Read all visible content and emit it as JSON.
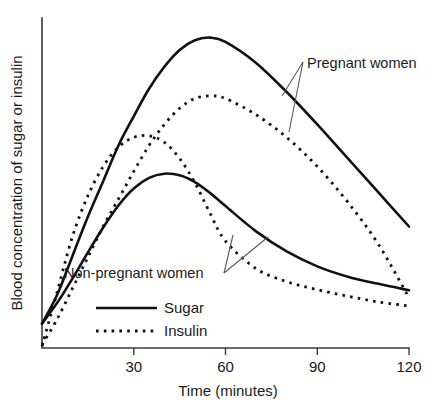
{
  "chart_data": {
    "type": "line",
    "title": "",
    "xlabel": "Time (minutes)",
    "ylabel": "Blood concentration of sugar or insulin",
    "xlim": [
      0,
      120
    ],
    "ylim": [
      0,
      1
    ],
    "xticks": [
      30,
      60,
      90,
      120
    ],
    "xticklabels": [
      "30",
      "60",
      "90",
      "120"
    ],
    "yticks": [],
    "yticklabels": [],
    "grid": false,
    "legend_position": "bottom-left",
    "legend": [
      {
        "label": "Sugar",
        "style": "solid"
      },
      {
        "label": "Insulin",
        "style": "dotted"
      }
    ],
    "annotations": [
      {
        "text": "Pregnant women",
        "points_to": [
          "pregnant-sugar",
          "pregnant-insulin"
        ]
      },
      {
        "text": "Non-pregnant women",
        "points_to": [
          "non-pregnant-sugar",
          "non-pregnant-insulin"
        ]
      }
    ],
    "series": [
      {
        "name": "pregnant-sugar",
        "group": "Pregnant women",
        "measure": "Sugar",
        "style": "solid",
        "x": [
          0,
          5,
          10,
          15,
          20,
          25,
          30,
          35,
          40,
          45,
          50,
          55,
          60,
          70,
          80,
          90,
          100,
          110,
          120
        ],
        "y": [
          0.075,
          0.165,
          0.285,
          0.405,
          0.515,
          0.625,
          0.715,
          0.8,
          0.868,
          0.92,
          0.95,
          0.958,
          0.945,
          0.88,
          0.79,
          0.69,
          0.585,
          0.48,
          0.375
        ]
      },
      {
        "name": "pregnant-insulin",
        "group": "Pregnant women",
        "measure": "Insulin",
        "style": "dotted",
        "x": [
          0,
          5,
          10,
          15,
          20,
          25,
          30,
          35,
          40,
          45,
          50,
          55,
          60,
          70,
          80,
          90,
          100,
          110,
          120
        ],
        "y": [
          0.01,
          0.09,
          0.185,
          0.28,
          0.375,
          0.46,
          0.545,
          0.625,
          0.69,
          0.74,
          0.77,
          0.778,
          0.77,
          0.72,
          0.65,
          0.56,
          0.45,
          0.32,
          0.155
        ]
      },
      {
        "name": "non-pregnant-sugar",
        "group": "Non-pregnant women",
        "measure": "Sugar",
        "style": "solid",
        "x": [
          0,
          5,
          10,
          15,
          20,
          25,
          30,
          35,
          40,
          45,
          50,
          55,
          60,
          70,
          80,
          90,
          100,
          110,
          120
        ],
        "y": [
          0.075,
          0.14,
          0.215,
          0.295,
          0.372,
          0.44,
          0.492,
          0.525,
          0.538,
          0.533,
          0.512,
          0.478,
          0.438,
          0.36,
          0.298,
          0.252,
          0.22,
          0.198,
          0.178
        ]
      },
      {
        "name": "non-pregnant-insulin",
        "group": "Non-pregnant women",
        "measure": "Insulin",
        "style": "dotted",
        "x": [
          0,
          5,
          10,
          15,
          20,
          25,
          30,
          35,
          40,
          45,
          50,
          55,
          60,
          70,
          80,
          90,
          100,
          110,
          120
        ],
        "y": [
          0.005,
          0.175,
          0.345,
          0.47,
          0.56,
          0.62,
          0.65,
          0.655,
          0.635,
          0.585,
          0.51,
          0.415,
          0.33,
          0.245,
          0.205,
          0.18,
          0.16,
          0.142,
          0.13
        ]
      }
    ]
  },
  "axes": {
    "x_title": "Time (minutes)",
    "y_title": "Blood concentration of sugar or insulin",
    "x_tick_labels": [
      "30",
      "60",
      "90",
      "120"
    ]
  },
  "legend": {
    "sugar_label": "Sugar",
    "insulin_label": "Insulin"
  },
  "annotations": {
    "pregnant_label": "Pregnant women",
    "non_pregnant_label": "Non-pregnant women"
  },
  "colors": {
    "line": "#111111",
    "axis": "#3b3b3b",
    "leader": "#5a5a5a",
    "background": "#ffffff",
    "text": "#1a1a1a"
  }
}
